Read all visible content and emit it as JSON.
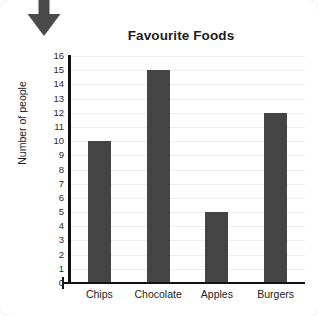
{
  "card": {
    "background": "#ffffff"
  },
  "annotation": {
    "arrow_icon": "arrow-down-icon",
    "color": "#4a4a4a"
  },
  "chart_data": {
    "type": "bar",
    "title": "Favourite Foods",
    "xlabel": "",
    "ylabel": "Number of people",
    "categories": [
      "Chips",
      "Chocolate",
      "Apples",
      "Burgers"
    ],
    "values": [
      10,
      15,
      5,
      12
    ],
    "ylim": [
      0,
      16
    ],
    "ytick_labels": [
      "16",
      "15",
      "14",
      "13",
      "12",
      "11",
      "10",
      "9",
      "8",
      "7",
      "6",
      "5",
      "4",
      "3",
      "2",
      "1",
      "0"
    ],
    "ytick_values": [
      16,
      15,
      14,
      13,
      12,
      11,
      10,
      9,
      8,
      7,
      6,
      5,
      4,
      3,
      2,
      1,
      0
    ],
    "grid": true,
    "grid_color": "#ededed",
    "bar_color": "#444444",
    "axis_color": "#111111",
    "legend": null
  }
}
